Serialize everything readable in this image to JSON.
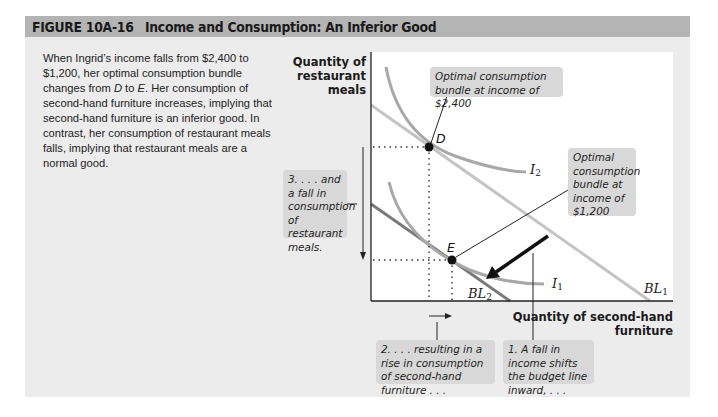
{
  "figure": {
    "number": "FIGURE  10A-16",
    "title": "Income and Consumption: An Inferior Good"
  },
  "caption": {
    "text_parts": [
      "When Ingrid’s income falls from $2,400 to $1,200, her optimal consumption bundle changes from ",
      "D",
      " to ",
      "E",
      ". Her consumption of second-hand furniture increases, implying that second-hand furniture is an inferior good. In contrast, her consumption of restaurant meals falls, implying that restaurant meals are a normal good."
    ]
  },
  "axes": {
    "y_label": "Quantity of restaurant meals",
    "x_label": "Quantity of second-hand furniture"
  },
  "points": {
    "D": "D",
    "E": "E"
  },
  "curves": {
    "I2": {
      "name": "I",
      "sub": "2"
    },
    "I1": {
      "name": "I",
      "sub": "1"
    },
    "BL1": {
      "name": "BL",
      "sub": "1"
    },
    "BL2": {
      "name": "BL",
      "sub": "2"
    }
  },
  "callouts": {
    "optimal_2400": "Optimal consumption bundle at income of $2,400",
    "optimal_1200": "Optimal consumption bundle at income of $1,200",
    "step1": "1. A fall in income shifts the budget line inward, . . .",
    "step2": "2. . . . resulting in a rise in consumption of second-hand furniture . . .",
    "step3": "3. . . . and a fall in consumption of restaurant meals."
  },
  "colors": {
    "title_bar": "#b4b4b4",
    "panel": "#ececec",
    "callout_bg": "#d8d8d8",
    "bl1": "#c4c4c4",
    "bl2": "#7a7a7a",
    "indiff": "#a8a8a8"
  }
}
